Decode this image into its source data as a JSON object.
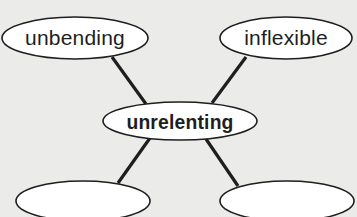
{
  "diagram": {
    "type": "word-web",
    "center": {
      "label": "unrelenting"
    },
    "nodes": [
      {
        "id": "top-left",
        "label": "unbending"
      },
      {
        "id": "top-right",
        "label": "inflexible"
      },
      {
        "id": "bottom-left",
        "label": ""
      },
      {
        "id": "bottom-right",
        "label": ""
      }
    ],
    "colors": {
      "background": "#ebebea",
      "node_fill": "#ffffff",
      "stroke": "#1e1e1e"
    }
  }
}
